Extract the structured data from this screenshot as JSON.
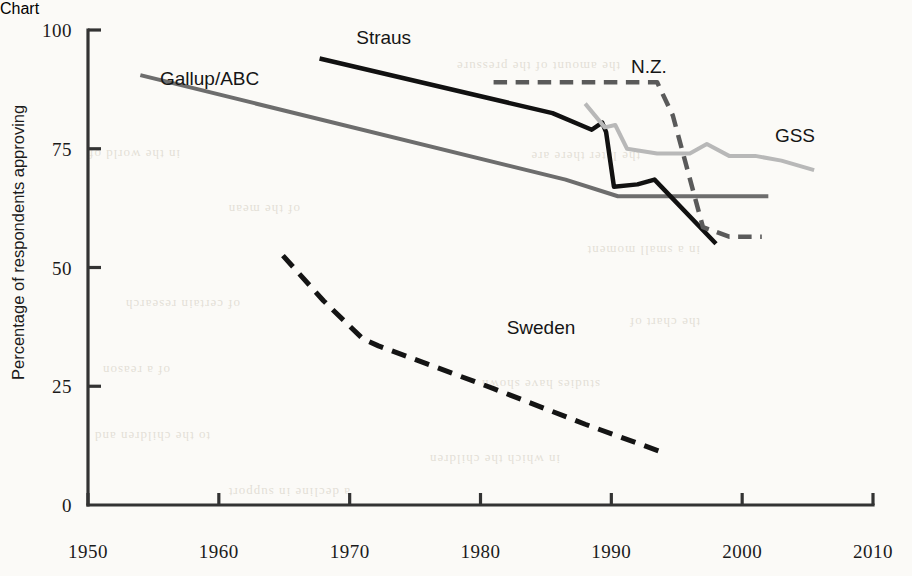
{
  "chart_data": {
    "type": "line",
    "title": "",
    "xlabel": "",
    "ylabel": "Percentage of respondents approving",
    "xlim": [
      1950,
      2010
    ],
    "ylim": [
      0,
      100
    ],
    "grid": false,
    "legend_position": "inline-labels",
    "xticks": [
      "1950",
      "1960",
      "1970",
      "1980",
      "1990",
      "2000",
      "2010"
    ],
    "xtick_values": [
      1950,
      1960,
      1970,
      1980,
      1990,
      2000,
      2010
    ],
    "yticks": [
      "0",
      "25",
      "50",
      "75",
      "100"
    ],
    "ytick_values": [
      0,
      25,
      50,
      75,
      100
    ],
    "series": [
      {
        "name": "Gallup/ABC",
        "label": "Gallup/ABC",
        "color": "#6d6d6d",
        "style": "solid",
        "width": 4,
        "label_x": 1955.5,
        "label_y": 88.5,
        "points": [
          [
            1954.0,
            90.5
          ],
          [
            1986.5,
            68.5
          ],
          [
            1990.5,
            65.0
          ],
          [
            1995.0,
            65.0
          ],
          [
            2002.0,
            65.0
          ]
        ]
      },
      {
        "name": "Straus",
        "label": "Straus",
        "color": "#111111",
        "style": "solid",
        "width": 4.5,
        "label_x": 1970.5,
        "label_y": 97.0,
        "points": [
          [
            1967.7,
            94.0
          ],
          [
            1985.5,
            82.5
          ],
          [
            1988.5,
            79.0
          ],
          [
            1989.3,
            80.5
          ],
          [
            1989.6,
            78.5
          ],
          [
            1990.2,
            67.0
          ],
          [
            1992.0,
            67.5
          ],
          [
            1993.3,
            68.5
          ],
          [
            1998.0,
            55.0
          ]
        ]
      },
      {
        "name": "N.Z.",
        "label": "N.Z.",
        "color": "#5a5a5a",
        "style": "dashed",
        "width": 4.5,
        "label_x": 1991.5,
        "label_y": 91.0,
        "points": [
          [
            1981.0,
            89.0
          ],
          [
            1993.5,
            89.0
          ],
          [
            1994.7,
            82.0
          ],
          [
            1997.0,
            58.5
          ],
          [
            1999.0,
            56.5
          ],
          [
            2001.5,
            56.5
          ]
        ]
      },
      {
        "name": "GSS",
        "label": "GSS",
        "color": "#b8b8b8",
        "style": "solid",
        "width": 4,
        "label_x": 2002.5,
        "label_y": 76.5,
        "points": [
          [
            1988.0,
            84.5
          ],
          [
            1989.5,
            79.5
          ],
          [
            1990.3,
            80.0
          ],
          [
            1991.2,
            75.0
          ],
          [
            1993.5,
            74.0
          ],
          [
            1996.0,
            74.0
          ],
          [
            1997.3,
            76.0
          ],
          [
            1999.0,
            73.5
          ],
          [
            2001.0,
            73.5
          ],
          [
            2003.0,
            72.5
          ],
          [
            2005.5,
            70.5
          ]
        ]
      },
      {
        "name": "Sweden",
        "label": "Sweden",
        "color": "#141414",
        "style": "dashed",
        "width": 5,
        "label_x": 1982.0,
        "label_y": 36.0,
        "points": [
          [
            1964.9,
            52.5
          ],
          [
            1968.0,
            43.0
          ],
          [
            1971.0,
            35.0
          ],
          [
            1972.2,
            33.5
          ],
          [
            1981.0,
            24.5
          ],
          [
            1988.0,
            17.0
          ],
          [
            1994.0,
            11.0
          ]
        ]
      }
    ]
  },
  "bleed_text": [
    {
      "t": "the amount of the pressure",
      "x": 620,
      "y": 62
    },
    {
      "t": "in the world of",
      "x": 180,
      "y": 150
    },
    {
      "t": "the later there are",
      "x": 640,
      "y": 152
    },
    {
      "t": "of the mean",
      "x": 300,
      "y": 205
    },
    {
      "t": "in a small moment",
      "x": 700,
      "y": 246
    },
    {
      "t": "of certain research",
      "x": 240,
      "y": 300
    },
    {
      "t": "the chart of",
      "x": 700,
      "y": 318
    },
    {
      "t": "of a reason",
      "x": 170,
      "y": 366
    },
    {
      "t": "studies have shown",
      "x": 600,
      "y": 380
    },
    {
      "t": "to the children and",
      "x": 210,
      "y": 432
    },
    {
      "t": "in which the children",
      "x": 560,
      "y": 455
    },
    {
      "t": "a decline in support",
      "x": 350,
      "y": 488
    }
  ]
}
